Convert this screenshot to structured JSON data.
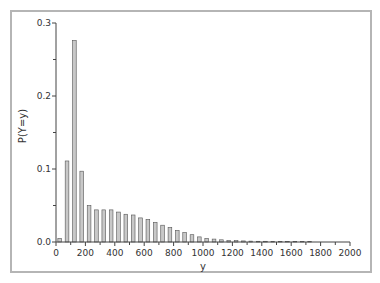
{
  "chart_data": {
    "type": "bar",
    "title": "",
    "xlabel": "y",
    "ylabel": "P(Y=y)",
    "xlim": [
      0,
      2000
    ],
    "ylim": [
      0,
      0.3
    ],
    "x_ticks": [
      "0",
      "200",
      "400",
      "600",
      "800",
      "1000",
      "1200",
      "1400",
      "1600",
      "1800",
      "2000"
    ],
    "y_ticks": [
      "0.0",
      "0.1",
      "0.2",
      "0.3"
    ],
    "grid": false,
    "legend": null,
    "bar_width": 25,
    "x": [
      25,
      75,
      125,
      175,
      225,
      275,
      325,
      375,
      425,
      475,
      525,
      575,
      625,
      675,
      725,
      775,
      825,
      875,
      925,
      975,
      1025,
      1075,
      1125,
      1175,
      1225,
      1275,
      1325,
      1375,
      1425,
      1475,
      1525,
      1575,
      1625,
      1675,
      1725
    ],
    "values": [
      0.005,
      0.111,
      0.276,
      0.097,
      0.05,
      0.044,
      0.044,
      0.044,
      0.041,
      0.038,
      0.037,
      0.033,
      0.031,
      0.027,
      0.023,
      0.02,
      0.016,
      0.013,
      0.01,
      0.007,
      0.005,
      0.004,
      0.003,
      0.002,
      0.002,
      0.0015,
      0.0012,
      0.001,
      0.001,
      0.0008,
      0.0007,
      0.0006,
      0.0005,
      0.0004,
      0.0003
    ]
  },
  "colors": {
    "bar_fill": "#c8c8c8",
    "bar_stroke": "#555555",
    "axis": "#444444",
    "frame": "#b5b5b5"
  }
}
